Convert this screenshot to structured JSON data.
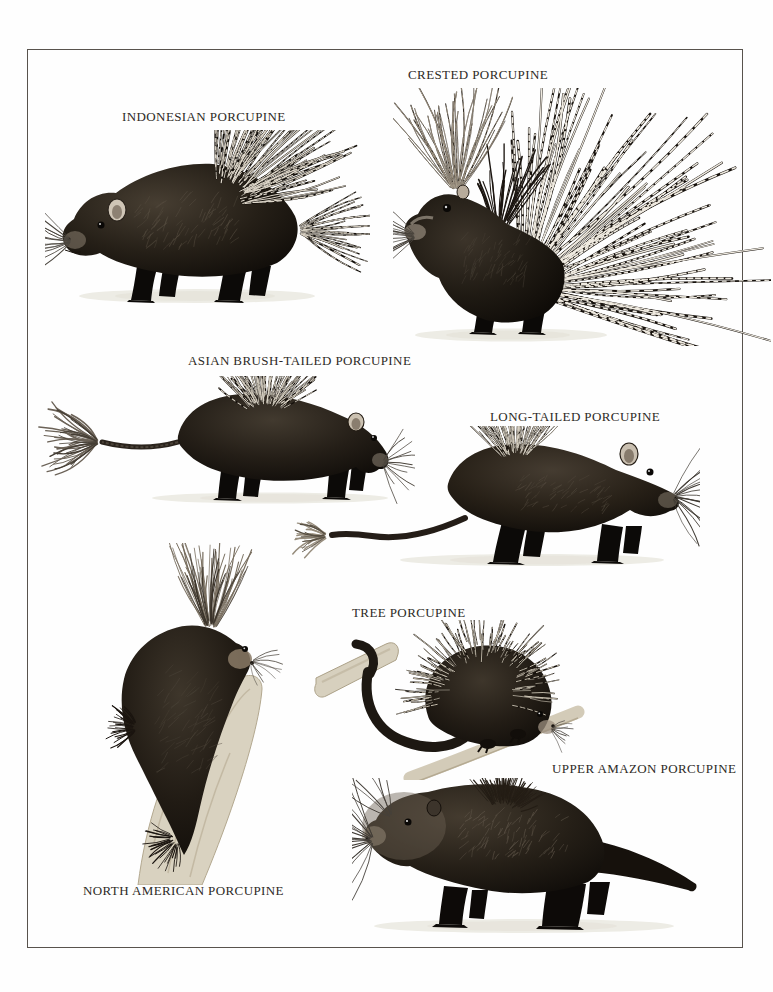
{
  "labels": {
    "indonesian": "INDONESIAN PORCUPINE",
    "crested": "CRESTED PORCUPINE",
    "asian_brush_tailed": "ASIAN BRUSH-TAILED PORCUPINE",
    "long_tailed": "LONG-TAILED PORCUPINE",
    "tree": "TREE PORCUPINE",
    "upper_amazon": "UPPER AMAZON PORCUPINE",
    "north_american": "NORTH AMERICAN PORCUPINE"
  },
  "colors": {
    "page_background": "#fefefe",
    "frame_line": "#58534d",
    "label_text": "#2d2a26",
    "ink_dark": "#14100b",
    "branch_tan": "#d9d2c0",
    "ground_shadow": "#edece5"
  }
}
